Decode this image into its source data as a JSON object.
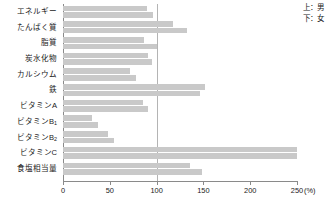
{
  "chart_data": {
    "type": "bar",
    "orientation": "horizontal",
    "title": "",
    "xlabel": "(%)",
    "ylabel": "",
    "xlim": [
      0,
      250
    ],
    "xticks": [
      0,
      50,
      100,
      150,
      200,
      250
    ],
    "xtick_labels": [
      "0",
      "50",
      "100",
      "150",
      "200",
      "250"
    ],
    "unit": "(%)",
    "grid": false,
    "reference_line": 100,
    "legend_position": "top-right",
    "categories": [
      "エネルギー",
      "たんぱく質",
      "脂質",
      "炭水化物",
      "カルシウム",
      "鉄",
      "ビタミンA",
      "ビタミンB1",
      "ビタミンB2",
      "ビタミンC",
      "食塩相当量"
    ],
    "series": [
      {
        "name": "男",
        "position": "上",
        "values": [
          90,
          118,
          87,
          91,
          72,
          152,
          85,
          31,
          48,
          250,
          136
        ]
      },
      {
        "name": "女",
        "position": "下",
        "values": [
          96,
          132,
          100,
          95,
          78,
          146,
          91,
          37,
          55,
          250,
          148
        ]
      }
    ]
  },
  "legend": {
    "male_entry": "上：男",
    "female_entry": "下：女"
  },
  "category_labels": [
    {
      "text": "エネルギー",
      "sub": ""
    },
    {
      "text": "たんぱく質",
      "sub": ""
    },
    {
      "text": "脂質",
      "sub": ""
    },
    {
      "text": "炭水化物",
      "sub": ""
    },
    {
      "text": "カルシウム",
      "sub": ""
    },
    {
      "text": "鉄",
      "sub": ""
    },
    {
      "text": "ビタミンA",
      "sub": ""
    },
    {
      "text": "ビタミンB",
      "sub": "1"
    },
    {
      "text": "ビタミンB",
      "sub": "2"
    },
    {
      "text": "ビタミンC",
      "sub": ""
    },
    {
      "text": "食塩相当量",
      "sub": ""
    }
  ],
  "colors": {
    "bar": "#c9c9c9",
    "axis": "#8a8a8a",
    "reference_line": "#b4b4b4",
    "text": "#1a1a1a",
    "background": "#ffffff"
  }
}
